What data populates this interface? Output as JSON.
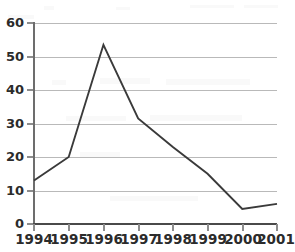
{
  "chart_data": {
    "type": "line",
    "title": "",
    "subtitle": "",
    "xlabel": "",
    "ylabel": "",
    "categories": [
      "1994",
      "1995",
      "1996",
      "1997",
      "1998",
      "1999",
      "2000",
      "2001"
    ],
    "values": [
      13,
      20,
      53.5,
      31.5,
      23,
      15,
      4.5,
      6
    ],
    "series": [
      {
        "name": "",
        "values": [
          13,
          20,
          53.5,
          31.5,
          23,
          15,
          4.5,
          6
        ]
      }
    ],
    "ylim": [
      0,
      60
    ],
    "y_ticks": [
      0,
      10,
      20,
      30,
      40,
      50,
      60
    ],
    "y_tick_labels": [
      "0",
      "10",
      "20",
      "30",
      "40",
      "50",
      "60"
    ],
    "x_tick_labels": [
      "1994",
      "1995",
      "1996",
      "1997",
      "1998",
      "1999",
      "2000",
      "2001"
    ],
    "grid": "horizontal",
    "legend": "none",
    "annotations": [],
    "colors": {
      "line": "#3a3a3a",
      "gridline": "#b9b9b9",
      "y_axis": "#6d6d6d",
      "x_axis": "#4a4a4a",
      "tick_label": "#2b2b2b",
      "background": "#ffffff"
    }
  }
}
